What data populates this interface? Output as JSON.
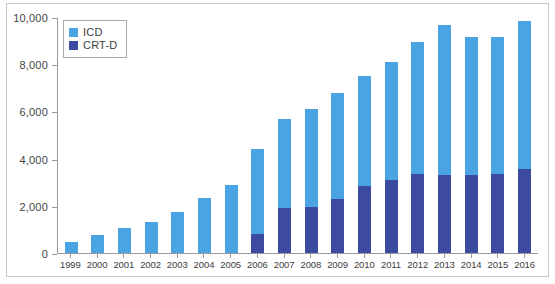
{
  "chart_data": {
    "type": "bar",
    "stacked": true,
    "title": "",
    "subtitle": "",
    "xlabel": "",
    "ylabel": "",
    "grid": false,
    "legend_position": "top-left",
    "ylim": [
      0,
      10000
    ],
    "yticks": [
      0,
      2000,
      4000,
      6000,
      8000,
      10000
    ],
    "ytick_labels": [
      "0",
      "2,000",
      "4,000",
      "6,000",
      "8,000",
      "10,000"
    ],
    "categories": [
      "1999",
      "2000",
      "2001",
      "2002",
      "2003",
      "2004",
      "2005",
      "2006",
      "2007",
      "2008",
      "2009",
      "2010",
      "2011",
      "2012",
      "2013",
      "2014",
      "2015",
      "2016"
    ],
    "series": [
      {
        "name": "CRT-D",
        "color": "#3c4aa0",
        "values": [
          0,
          0,
          0,
          0,
          0,
          0,
          0,
          800,
          1900,
          1950,
          2300,
          2850,
          3100,
          3350,
          3300,
          3300,
          3350,
          3550
        ]
      },
      {
        "name": "ICD",
        "color": "#4aa3e3",
        "values": [
          450,
          750,
          1050,
          1300,
          1750,
          2350,
          2900,
          3600,
          3800,
          4150,
          4500,
          4650,
          5000,
          5600,
          6350,
          5850,
          5800,
          6300
        ]
      }
    ],
    "totals": [
      450,
      750,
      1050,
      1300,
      1750,
      2350,
      2900,
      4400,
      5700,
      6100,
      6800,
      7500,
      8100,
      8950,
      9650,
      9150,
      9150,
      9850
    ]
  },
  "legend": {
    "items": [
      {
        "label": "ICD",
        "color": "#4aa3e3"
      },
      {
        "label": "CRT-D",
        "color": "#3c4aa0"
      }
    ]
  },
  "colors": {
    "icd": "#4aa3e3",
    "crtd": "#3c4aa0",
    "axis": "#9a9a9a",
    "frame": "#c8c8c8",
    "background": "#ffffff",
    "text": "#454545"
  }
}
